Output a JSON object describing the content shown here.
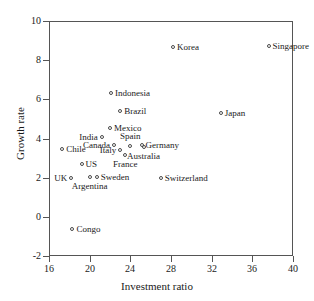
{
  "chart_data": {
    "type": "scatter",
    "title": "",
    "xlabel": "Investment ratio",
    "ylabel": "Growth rate",
    "xlim": [
      16,
      40
    ],
    "ylim": [
      -2,
      10
    ],
    "xticks": [
      16,
      20,
      24,
      28,
      32,
      36,
      40
    ],
    "yticks": [
      10,
      8,
      6,
      4,
      2,
      0,
      -2
    ],
    "grid": false,
    "legend": "none",
    "marker": "open-circle",
    "points": [
      {
        "label": "Korea",
        "x": 28.2,
        "y": 8.65,
        "label_pos": "right"
      },
      {
        "label": "Singapore",
        "x": 37.6,
        "y": 8.7,
        "label_pos": "right"
      },
      {
        "label": "Indonesia",
        "x": 22.1,
        "y": 6.3,
        "label_pos": "right"
      },
      {
        "label": "Brazil",
        "x": 23.0,
        "y": 5.4,
        "label_pos": "right"
      },
      {
        "label": "Japan",
        "x": 32.9,
        "y": 5.3,
        "label_pos": "right"
      },
      {
        "label": "Mexico",
        "x": 22.0,
        "y": 4.55,
        "label_pos": "right"
      },
      {
        "label": "India",
        "x": 21.2,
        "y": 4.1,
        "label_pos": "left"
      },
      {
        "label": "Spain",
        "x": 24.0,
        "y": 3.6,
        "label_pos": "above"
      },
      {
        "label": "Canada",
        "x": 22.4,
        "y": 3.65,
        "label_pos": "left"
      },
      {
        "label": "Germany",
        "x": 25.1,
        "y": 3.65,
        "label_pos": "right"
      },
      {
        "label": "Australia",
        "x": 25.3,
        "y": 3.55,
        "label_pos": "below"
      },
      {
        "label": "Chile",
        "x": 17.3,
        "y": 3.45,
        "label_pos": "right"
      },
      {
        "label": "Italy",
        "x": 23.0,
        "y": 3.4,
        "label_pos": "left"
      },
      {
        "label": "France",
        "x": 23.5,
        "y": 3.15,
        "label_pos": "below"
      },
      {
        "label": "US",
        "x": 19.2,
        "y": 2.7,
        "label_pos": "right"
      },
      {
        "label": "UK",
        "x": 18.2,
        "y": 2.0,
        "label_pos": "left"
      },
      {
        "label": "Argentina",
        "x": 20.0,
        "y": 2.05,
        "label_pos": "below"
      },
      {
        "label": "Sweden",
        "x": 20.7,
        "y": 2.05,
        "label_pos": "right"
      },
      {
        "label": "Switzerland",
        "x": 27.0,
        "y": 2.0,
        "label_pos": "right"
      },
      {
        "label": "Congo",
        "x": 18.3,
        "y": -0.6,
        "label_pos": "right"
      }
    ]
  }
}
